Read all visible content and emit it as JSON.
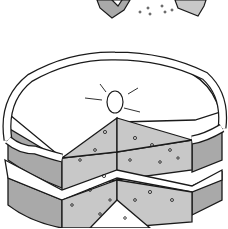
{
  "illustration": {
    "subject": "layered cake with a slice removed",
    "style": "black-and-white line art, grey shading",
    "colors": {
      "outline": "#1a1a1a",
      "sponge": "#c8c8c8",
      "side": "#a9a9a9",
      "icing": "#ffffff",
      "background": "#ffffff"
    }
  }
}
